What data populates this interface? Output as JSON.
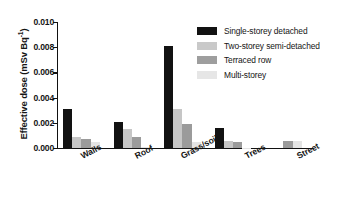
{
  "chart_data": {
    "type": "bar",
    "title": "",
    "xlabel": "",
    "ylabel": "Effective dose (mSv Bq",
    "ylabel_sup": "-1",
    "ylabel_suffix": ")",
    "ylabel_full": "Effective dose (mSv Bq-1)",
    "categories": [
      "Walls",
      "Roof",
      "Grass/soil",
      "Trees",
      "Street"
    ],
    "series": [
      {
        "name": "Single-storey detached",
        "color": "#121212",
        "values": [
          0.0031,
          0.0021,
          0.0081,
          0.0016,
          0.0
        ]
      },
      {
        "name": "Two-storey semi-detached",
        "color": "#c9c9c9",
        "values": [
          0.00085,
          0.0015,
          0.0031,
          0.00055,
          0.0
        ]
      },
      {
        "name": "Terraced row",
        "color": "#9e9e9e",
        "values": [
          0.0007,
          0.0009,
          0.0019,
          0.0005,
          0.00052
        ]
      },
      {
        "name": "Multi-storey",
        "color": "#e6e6e6",
        "values": [
          0.00045,
          5e-05,
          0.00045,
          4e-05,
          0.00055
        ]
      }
    ],
    "ylim": [
      0.0,
      0.01
    ],
    "yticks": [
      0.0,
      0.002,
      0.004,
      0.006,
      0.008,
      0.01
    ],
    "ytick_labels": [
      "0.000",
      "0.002",
      "0.004",
      "0.006",
      "0.008",
      "0.010"
    ],
    "grid": false,
    "legend_position": "top-right"
  }
}
